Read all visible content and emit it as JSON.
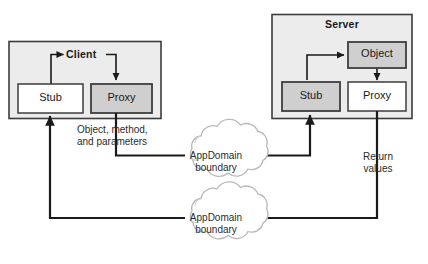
{
  "diagram": {
    "colors": {
      "container_fill": "#ececec",
      "container_stroke": "#3d3d3d",
      "gray_box_fill": "#cfcfcf",
      "white_box_fill": "#ffffff",
      "box_stroke": "#3d3d3d",
      "line": "#1a1a1a",
      "cloud_stroke": "#b8b8b8",
      "cloud_fill": "#ffffff",
      "text": "#1a1a1a"
    },
    "containers": [
      {
        "id": "client",
        "label": "Client"
      },
      {
        "id": "server",
        "label": "Server"
      }
    ],
    "nodes": [
      {
        "id": "client-stub",
        "label": "Stub",
        "fill": "white"
      },
      {
        "id": "client-proxy",
        "label": "Proxy",
        "fill": "gray"
      },
      {
        "id": "server-object",
        "label": "Object",
        "fill": "gray"
      },
      {
        "id": "server-stub",
        "label": "Stub",
        "fill": "gray"
      },
      {
        "id": "server-proxy",
        "label": "Proxy",
        "fill": "white"
      }
    ],
    "clouds": [
      {
        "id": "cloud-top",
        "line1": "AppDomain",
        "line2": "boundary"
      },
      {
        "id": "cloud-bottom",
        "line1": "AppDomain",
        "line2": "boundary"
      }
    ],
    "edge_labels": [
      {
        "id": "request-label",
        "line1": "Object, method,",
        "line2": "and parameters"
      },
      {
        "id": "return-label",
        "line1": "Return",
        "line2": "values"
      }
    ]
  }
}
